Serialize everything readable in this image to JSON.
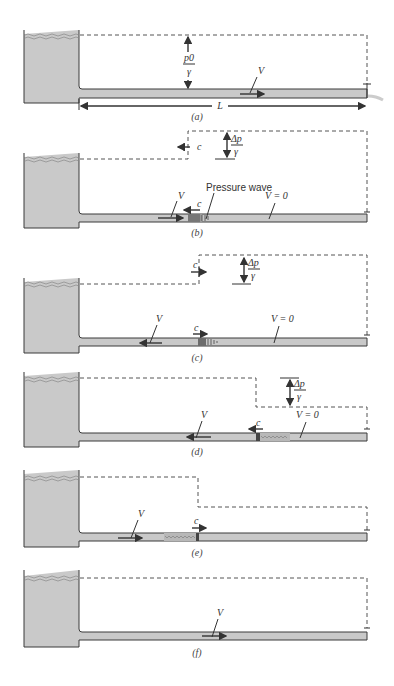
{
  "figure": {
    "panels": [
      {
        "id": "a",
        "caption": "(a)",
        "labels": {
          "head": "p0",
          "head_den": "γ",
          "velocity": "V",
          "length": "L"
        }
      },
      {
        "id": "b",
        "caption": "(b)",
        "labels": {
          "wave_speed": "c",
          "dp_num": "Δp",
          "dp_den": "γ",
          "velocity": "V",
          "wave_speed_pipe": "c",
          "pressure_wave": "Pressure wave",
          "v_zero": "V = 0"
        }
      },
      {
        "id": "c",
        "caption": "(c)",
        "labels": {
          "wave_speed": "c",
          "dp_num": "Δp",
          "dp_den": "γ",
          "velocity": "V",
          "wave_speed_pipe": "c",
          "v_zero": "V = 0"
        }
      },
      {
        "id": "d",
        "caption": "(d)",
        "labels": {
          "dp_num": "Δp",
          "dp_den": "γ",
          "velocity": "V",
          "wave_speed_pipe": "c",
          "v_zero": "V = 0"
        }
      },
      {
        "id": "e",
        "caption": "(e)",
        "labels": {
          "velocity": "V",
          "wave_speed_pipe": "c"
        }
      },
      {
        "id": "f",
        "caption": "(f)",
        "labels": {
          "velocity": "V"
        }
      }
    ]
  }
}
